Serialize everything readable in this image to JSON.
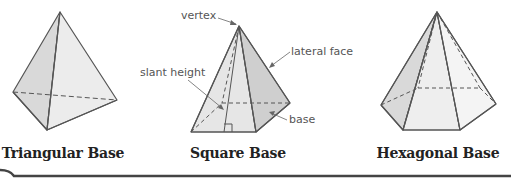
{
  "figure": {
    "pyramids": [
      {
        "id": "triangular",
        "caption": "Triangular Base"
      },
      {
        "id": "square",
        "caption": "Square Base"
      },
      {
        "id": "hexagonal",
        "caption": "Hexagonal Base"
      }
    ],
    "labels": {
      "vertex": "vertex",
      "lateral_face": "lateral face",
      "slant_height": "slant height",
      "base": "base"
    },
    "colors": {
      "edge": "#555555",
      "face_light": "#eeeeee",
      "face_mid": "#dedede",
      "face_dark": "#c9c9c9",
      "caption": "#222222",
      "label": "#555555",
      "bottom_rule": "#444444"
    }
  }
}
